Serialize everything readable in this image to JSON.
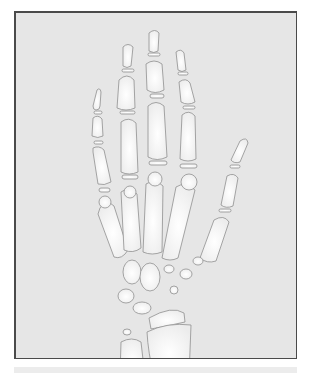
{
  "image": {
    "subject": "Illustration of hand and wrist bones (skeleton)",
    "colors": {
      "background": "#e6e6e6",
      "bone_fill": "#fafafa",
      "bone_outline": "#8f8f8f",
      "frame_border": "#4a4a4a"
    }
  }
}
